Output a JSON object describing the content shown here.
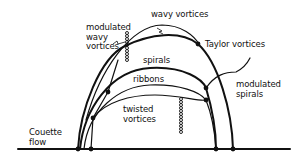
{
  "diagram": {
    "type": "flow-regime-diagram",
    "labels": {
      "wavy_vortices": "wavy vortices",
      "modulated_wavy_vortices": "modulated\nwavy\nvortices",
      "taylor_vortices": "Taylor vortices",
      "spirals": "spirals",
      "ribbons": "ribbons",
      "modulated_spirals": "modulated\nspirals",
      "twisted_vortices": "twisted\nvortices",
      "couette_flow": "Couette\nflow"
    },
    "colors": {
      "line": "#111111",
      "background": "#ffffff"
    }
  }
}
